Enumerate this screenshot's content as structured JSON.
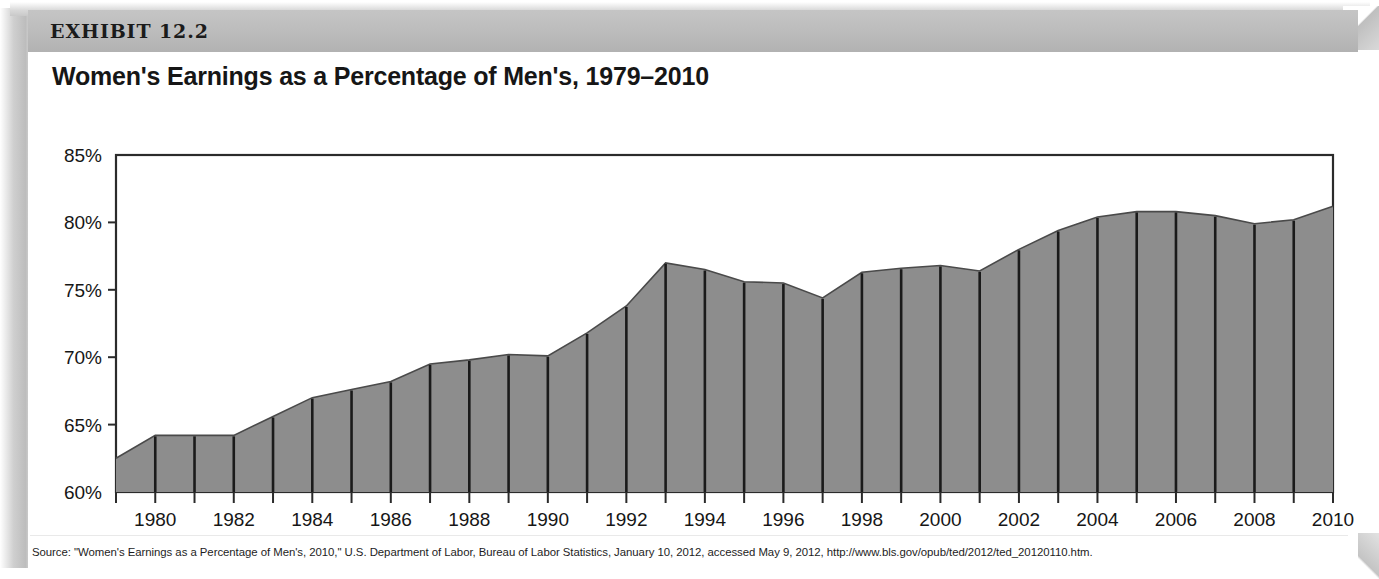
{
  "exhibit": {
    "label": "EXHIBIT 12.2",
    "title": "Women's Earnings as a Percentage of Men's, 1979–2010",
    "source": "Source: \"Women's Earnings as a Percentage of Men's, 2010,\" U.S. Department of Labor, Bureau of Labor Statistics, January 10, 2012, accessed May 9, 2012, http://www.bls.gov/opub/ted/2012/ted_20120110.htm."
  },
  "colors": {
    "header_bar": "#bdbdbd",
    "area_fill": "#8d8d8d",
    "area_line": "#4a4a4a",
    "separator_line": "#1a1a1a",
    "axis": "#2b2b2b",
    "text": "#161616"
  },
  "chart_data": {
    "type": "area",
    "title": "Women's Earnings as a Percentage of Men's, 1979–2010",
    "xlabel": "",
    "ylabel": "",
    "ylim": [
      60,
      85
    ],
    "xlim": [
      1979,
      2010
    ],
    "ytick_step": 5,
    "ytick_labels": [
      "60%",
      "65%",
      "70%",
      "75%",
      "80%",
      "85%"
    ],
    "ytick_values": [
      60,
      65,
      70,
      75,
      80,
      85
    ],
    "xtick_labels": [
      "1980",
      "1982",
      "1984",
      "1986",
      "1988",
      "1990",
      "1992",
      "1994",
      "1996",
      "1998",
      "2000",
      "2002",
      "2004",
      "2006",
      "2008",
      "2010"
    ],
    "xtick_values": [
      1980,
      1982,
      1984,
      1986,
      1988,
      1990,
      1992,
      1994,
      1996,
      1998,
      2000,
      2002,
      2004,
      2006,
      2008,
      2010
    ],
    "minor_ticks_every": 1,
    "grid": false,
    "legend": null,
    "x": [
      1979,
      1980,
      1981,
      1982,
      1983,
      1984,
      1985,
      1986,
      1987,
      1988,
      1989,
      1990,
      1991,
      1992,
      1993,
      1994,
      1995,
      1996,
      1997,
      1998,
      1999,
      2000,
      2001,
      2002,
      2003,
      2004,
      2005,
      2006,
      2007,
      2008,
      2009,
      2010
    ],
    "values": [
      62.5,
      64.2,
      64.2,
      64.2,
      65.6,
      67.0,
      67.6,
      68.2,
      69.5,
      69.8,
      70.2,
      70.1,
      71.8,
      73.8,
      77.0,
      76.5,
      75.6,
      75.5,
      74.4,
      76.3,
      76.6,
      76.8,
      76.4,
      78.0,
      79.4,
      80.4,
      80.8,
      80.8,
      80.5,
      79.9,
      80.2,
      81.2
    ],
    "unit": "percent",
    "series_name": "Women's earnings as a percentage of men's"
  }
}
